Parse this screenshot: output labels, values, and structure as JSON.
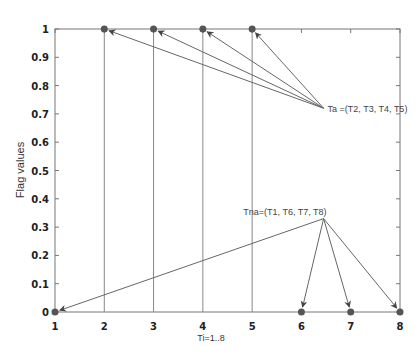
{
  "chart_data": {
    "type": "scatter",
    "title": "",
    "xlabel": "Ti=1..8",
    "ylabel": "Flag values",
    "xlim": [
      1,
      8
    ],
    "ylim": [
      0,
      1
    ],
    "x_ticks": [
      "1",
      "2",
      "3",
      "4",
      "5",
      "6",
      "7",
      "8"
    ],
    "y_ticks": [
      "0",
      "0.1",
      "0.2",
      "0.3",
      "0.4",
      "0.5",
      "0.6",
      "0.7",
      "0.8",
      "0.9",
      "1"
    ],
    "grid": false,
    "stems": [
      2,
      3,
      4,
      5
    ],
    "series": [
      {
        "name": "Flag",
        "x": [
          1,
          2,
          3,
          4,
          5,
          6,
          7,
          8
        ],
        "y": [
          0,
          1,
          1,
          1,
          1,
          0,
          0,
          0
        ]
      }
    ],
    "annotations": [
      {
        "text": "Ta =(T2, T3, T4, T5)",
        "anchor": [
          6.45,
          0.72
        ],
        "targets": [
          2,
          3,
          4,
          5
        ],
        "target_y": 1
      },
      {
        "text": "Tna=(T1, T6, T7, T8)",
        "anchor": [
          6.45,
          0.33
        ],
        "targets": [
          1,
          6,
          7,
          8
        ],
        "target_y": 0
      }
    ]
  },
  "colors": {
    "axis": "#777777",
    "marker": "#555555",
    "line": "#666666",
    "text": "#222222"
  }
}
